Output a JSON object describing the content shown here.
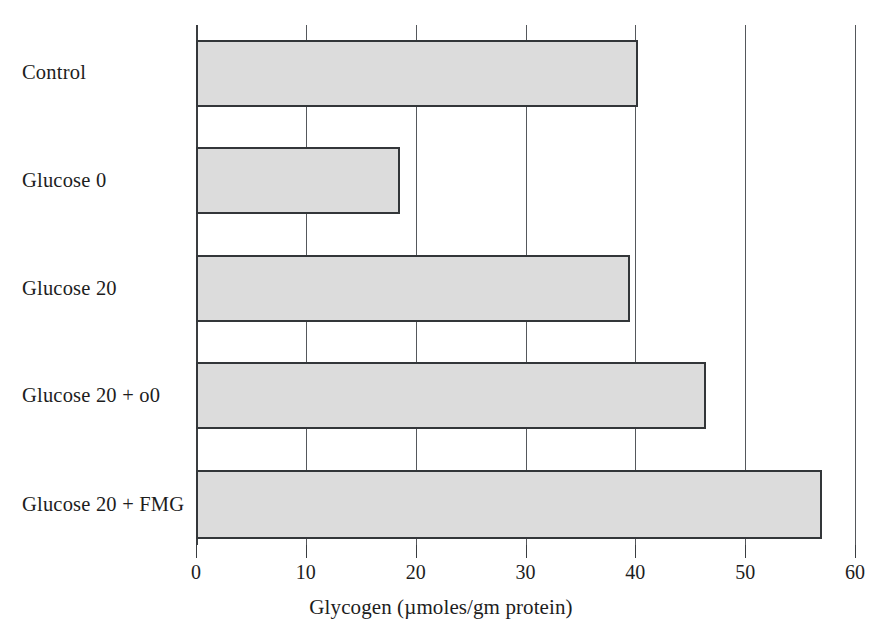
{
  "chart_data": {
    "type": "bar",
    "orientation": "horizontal",
    "title": "",
    "xlabel": "Glycogen (µmoles/gm protein)",
    "ylabel": "",
    "categories": [
      "Control",
      "Glucose 0",
      "Glucose 20",
      "Glucose 20 + o0",
      "Glucose 20 + FMG"
    ],
    "values": [
      40.2,
      18.6,
      39.5,
      46.4,
      57.0
    ],
    "xlim": [
      0,
      60
    ],
    "xticks": [
      0,
      10,
      20,
      30,
      40,
      50,
      60
    ],
    "xtick_labels": [
      "0",
      "10",
      "20",
      "30",
      "40",
      "50",
      "60"
    ],
    "grid": true,
    "grid_axis": "x",
    "legend": "none",
    "bar_fill_color": "#dcdcdc",
    "bar_edge_color": "#333639",
    "axis_color": "#3a3d40",
    "grid_color": "#55585c",
    "background_color": "#ffffff"
  }
}
